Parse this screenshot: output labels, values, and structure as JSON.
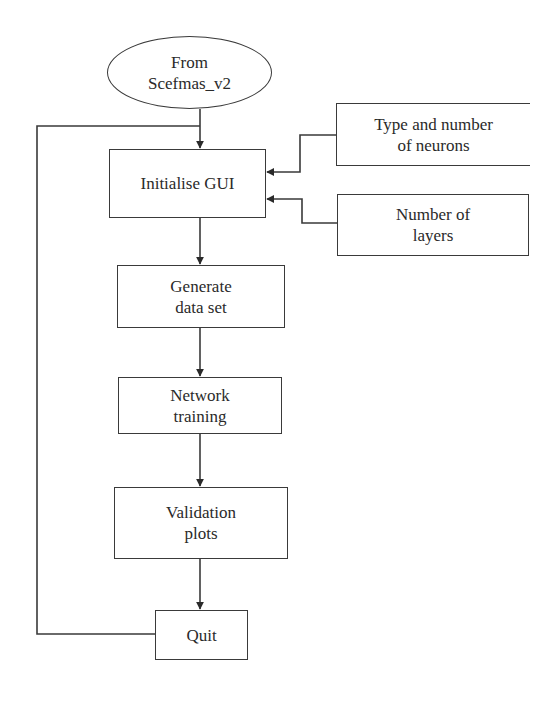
{
  "diagram": {
    "type": "flowchart",
    "background": "#ffffff",
    "stroke_color": "#3a3a3a",
    "text_color": "#2a2a2a",
    "nodes": {
      "start": {
        "label": "From\nScefmas_v2",
        "shape": "ellipse"
      },
      "init_gui": {
        "label": "Initialise GUI",
        "shape": "rectangle"
      },
      "neurons_input": {
        "label": "Type and number\nof neurons",
        "shape": "rectangle-open-right"
      },
      "layers_input": {
        "label": "Number of\nlayers",
        "shape": "rectangle"
      },
      "generate": {
        "label": "Generate\ndata set",
        "shape": "rectangle"
      },
      "training": {
        "label": "Network\ntraining",
        "shape": "rectangle"
      },
      "validation": {
        "label": "Validation\nplots",
        "shape": "rectangle"
      },
      "quit": {
        "label": "Quit",
        "shape": "rectangle"
      }
    },
    "edges": [
      {
        "from": "start",
        "to": "init_gui"
      },
      {
        "from": "neurons_input",
        "to": "init_gui"
      },
      {
        "from": "layers_input",
        "to": "init_gui"
      },
      {
        "from": "init_gui",
        "to": "generate"
      },
      {
        "from": "generate",
        "to": "training"
      },
      {
        "from": "training",
        "to": "validation"
      },
      {
        "from": "validation",
        "to": "quit"
      },
      {
        "from": "quit",
        "to": "init_gui",
        "kind": "loop-back"
      }
    ]
  }
}
